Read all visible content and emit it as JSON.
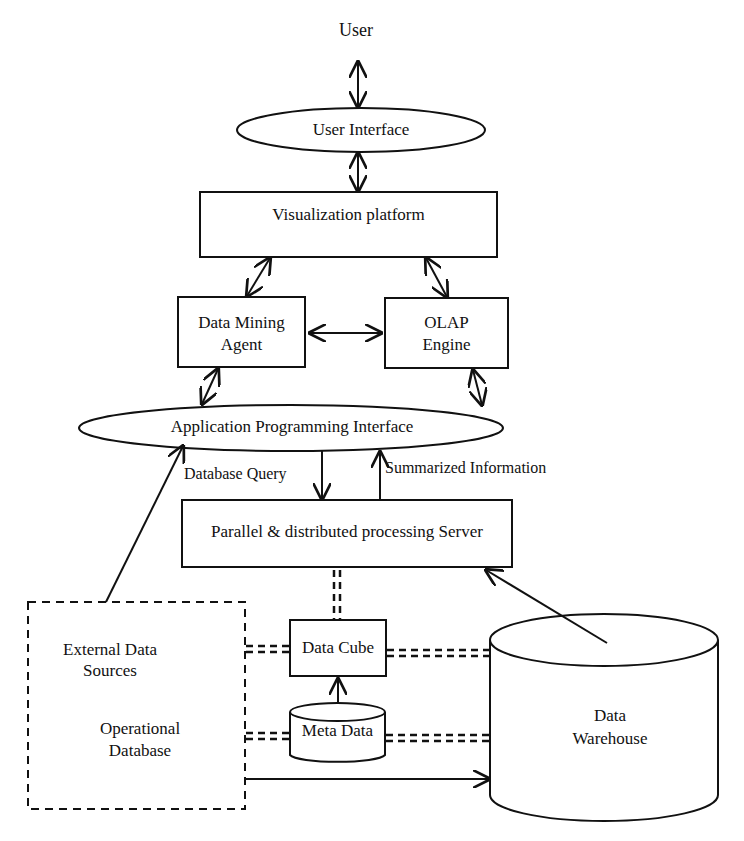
{
  "nodes": {
    "user": "User",
    "user_interface": "User Interface",
    "visualization": "Visualization platform",
    "data_mining_1": "Data Mining",
    "data_mining_2": "Agent",
    "olap_1": "OLAP",
    "olap_2": "Engine",
    "api": "Application Programming Interface",
    "server": "Parallel & distributed processing Server",
    "external_1": "External Data",
    "external_2": "Sources",
    "operational_1": "Operational",
    "operational_2": "Database",
    "data_cube": "Data Cube",
    "meta_data": "Meta Data",
    "warehouse_1": "Data",
    "warehouse_2": "Warehouse"
  },
  "edges": {
    "database_query": "Database Query",
    "summarized_info": "Summarized Information"
  },
  "colors": {
    "stroke": "#111111",
    "background": "#ffffff"
  }
}
